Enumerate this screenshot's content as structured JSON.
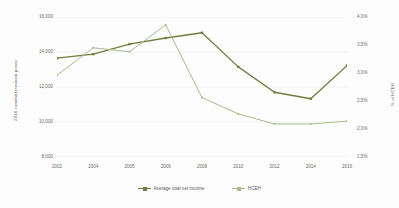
{
  "chart_data": {
    "type": "line",
    "title": "",
    "xlabel": "",
    "ylabel": "2016 constant mexican pesos",
    "y2label": "% of HCEH",
    "categories": [
      "2002",
      "2004",
      "2005",
      "2006",
      "2008",
      "2010",
      "2012",
      "2014",
      "2016"
    ],
    "ylim": [
      8000,
      16000
    ],
    "yticks": [
      "8,000",
      "10,000",
      "12,000",
      "14,000",
      "16,000"
    ],
    "ytick_values": [
      8000,
      10000,
      12000,
      14000,
      16000
    ],
    "y2lim": [
      1.5,
      4.0
    ],
    "y2ticks": [
      "1.5%",
      "2.0%",
      "2.5%",
      "3.0%",
      "3.5%",
      "4.0%"
    ],
    "y2tick_values": [
      1.5,
      2.0,
      2.5,
      3.0,
      3.5,
      4.0
    ],
    "grid": true,
    "legend_position": "bottom",
    "series": [
      {
        "name": "Average total net income",
        "axis": "left",
        "color": "#6d7f3f",
        "values": [
          13650,
          13880,
          14450,
          14800,
          15100,
          13150,
          11700,
          11330,
          13220
        ]
      },
      {
        "name": "HCEH",
        "axis": "right",
        "color": "#a9bb8c",
        "values": [
          2.96,
          3.45,
          3.38,
          3.86,
          2.56,
          2.27,
          2.09,
          2.09,
          2.14
        ]
      }
    ]
  },
  "legend": {
    "entries": [
      {
        "label": "Average total net income"
      },
      {
        "label": "HCEH"
      }
    ]
  },
  "colors": {
    "series_dark": "#6d7f3f",
    "series_light": "#a9bb8c",
    "gridline": "#ededea",
    "tick_text": "#6b6b66",
    "axis_title_text": "#5a5a56",
    "background": "#fdfdfd"
  }
}
